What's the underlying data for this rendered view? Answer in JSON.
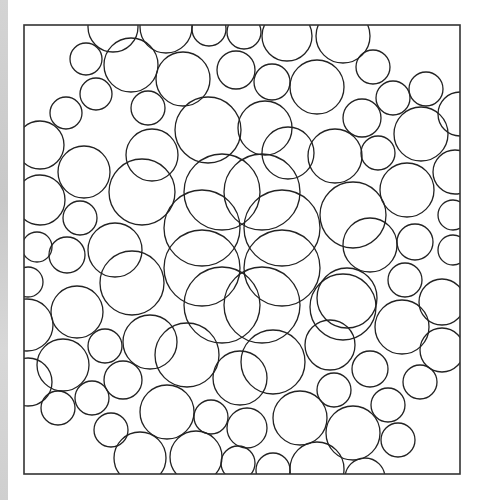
{
  "figure": {
    "frame": {
      "x": 24,
      "y": 25,
      "width": 436,
      "height": 449
    },
    "stroke_color": "#222222",
    "frame_color": "#333333",
    "background_color": "#ffffff",
    "side_strip_color": "#cfcfcf",
    "circles": [
      {
        "cx": 113,
        "cy": 27,
        "r": 25
      },
      {
        "cx": 166,
        "cy": 27,
        "r": 26
      },
      {
        "cx": 209,
        "cy": 29,
        "r": 17
      },
      {
        "cx": 244,
        "cy": 32,
        "r": 17
      },
      {
        "cx": 287,
        "cy": 36,
        "r": 25
      },
      {
        "cx": 343,
        "cy": 36,
        "r": 27
      },
      {
        "cx": 86,
        "cy": 59,
        "r": 16
      },
      {
        "cx": 131,
        "cy": 65,
        "r": 27
      },
      {
        "cx": 183,
        "cy": 79,
        "r": 27
      },
      {
        "cx": 236,
        "cy": 70,
        "r": 19
      },
      {
        "cx": 272,
        "cy": 82,
        "r": 18
      },
      {
        "cx": 317,
        "cy": 87,
        "r": 27
      },
      {
        "cx": 373,
        "cy": 67,
        "r": 17
      },
      {
        "cx": 393,
        "cy": 98,
        "r": 17
      },
      {
        "cx": 426,
        "cy": 89,
        "r": 17
      },
      {
        "cx": 460,
        "cy": 114,
        "r": 22
      },
      {
        "cx": 96,
        "cy": 94,
        "r": 16
      },
      {
        "cx": 66,
        "cy": 113,
        "r": 16
      },
      {
        "cx": 148,
        "cy": 108,
        "r": 17
      },
      {
        "cx": 208,
        "cy": 130,
        "r": 33
      },
      {
        "cx": 265,
        "cy": 128,
        "r": 27
      },
      {
        "cx": 362,
        "cy": 118,
        "r": 19
      },
      {
        "cx": 421,
        "cy": 134,
        "r": 27
      },
      {
        "cx": 40,
        "cy": 145,
        "r": 24
      },
      {
        "cx": 84,
        "cy": 172,
        "r": 26
      },
      {
        "cx": 152,
        "cy": 155,
        "r": 26
      },
      {
        "cx": 288,
        "cy": 153,
        "r": 26
      },
      {
        "cx": 335,
        "cy": 156,
        "r": 27
      },
      {
        "cx": 378,
        "cy": 153,
        "r": 17
      },
      {
        "cx": 455,
        "cy": 172,
        "r": 22
      },
      {
        "cx": 142,
        "cy": 192,
        "r": 33
      },
      {
        "cx": 40,
        "cy": 200,
        "r": 25
      },
      {
        "cx": 80,
        "cy": 218,
        "r": 17
      },
      {
        "cx": 407,
        "cy": 190,
        "r": 27
      },
      {
        "cx": 222,
        "cy": 192,
        "r": 38
      },
      {
        "cx": 262,
        "cy": 192,
        "r": 38
      },
      {
        "cx": 202,
        "cy": 228,
        "r": 38
      },
      {
        "cx": 282,
        "cy": 228,
        "r": 38
      },
      {
        "cx": 202,
        "cy": 268,
        "r": 38
      },
      {
        "cx": 282,
        "cy": 268,
        "r": 38
      },
      {
        "cx": 222,
        "cy": 305,
        "r": 38
      },
      {
        "cx": 262,
        "cy": 305,
        "r": 38
      },
      {
        "cx": 353,
        "cy": 215,
        "r": 33
      },
      {
        "cx": 453,
        "cy": 215,
        "r": 15
      },
      {
        "cx": 37,
        "cy": 247,
        "r": 15
      },
      {
        "cx": 67,
        "cy": 255,
        "r": 18
      },
      {
        "cx": 115,
        "cy": 250,
        "r": 27
      },
      {
        "cx": 370,
        "cy": 245,
        "r": 27
      },
      {
        "cx": 415,
        "cy": 242,
        "r": 18
      },
      {
        "cx": 453,
        "cy": 250,
        "r": 15
      },
      {
        "cx": 28,
        "cy": 282,
        "r": 15
      },
      {
        "cx": 132,
        "cy": 283,
        "r": 32
      },
      {
        "cx": 405,
        "cy": 280,
        "r": 17
      },
      {
        "cx": 347,
        "cy": 298,
        "r": 30
      },
      {
        "cx": 442,
        "cy": 302,
        "r": 23
      },
      {
        "cx": 77,
        "cy": 312,
        "r": 26
      },
      {
        "cx": 27,
        "cy": 325,
        "r": 26
      },
      {
        "cx": 343,
        "cy": 307,
        "r": 33
      },
      {
        "cx": 402,
        "cy": 327,
        "r": 27
      },
      {
        "cx": 105,
        "cy": 346,
        "r": 17
      },
      {
        "cx": 150,
        "cy": 342,
        "r": 27
      },
      {
        "cx": 187,
        "cy": 355,
        "r": 32
      },
      {
        "cx": 273,
        "cy": 362,
        "r": 32
      },
      {
        "cx": 240,
        "cy": 378,
        "r": 27
      },
      {
        "cx": 330,
        "cy": 345,
        "r": 25
      },
      {
        "cx": 442,
        "cy": 350,
        "r": 22
      },
      {
        "cx": 63,
        "cy": 365,
        "r": 26
      },
      {
        "cx": 28,
        "cy": 382,
        "r": 24
      },
      {
        "cx": 123,
        "cy": 380,
        "r": 19
      },
      {
        "cx": 370,
        "cy": 369,
        "r": 18
      },
      {
        "cx": 420,
        "cy": 382,
        "r": 17
      },
      {
        "cx": 334,
        "cy": 390,
        "r": 17
      },
      {
        "cx": 58,
        "cy": 408,
        "r": 17
      },
      {
        "cx": 92,
        "cy": 398,
        "r": 17
      },
      {
        "cx": 167,
        "cy": 412,
        "r": 27
      },
      {
        "cx": 211,
        "cy": 417,
        "r": 17
      },
      {
        "cx": 247,
        "cy": 428,
        "r": 20
      },
      {
        "cx": 300,
        "cy": 418,
        "r": 27
      },
      {
        "cx": 388,
        "cy": 405,
        "r": 17
      },
      {
        "cx": 353,
        "cy": 433,
        "r": 27
      },
      {
        "cx": 398,
        "cy": 440,
        "r": 17
      },
      {
        "cx": 111,
        "cy": 430,
        "r": 17
      },
      {
        "cx": 140,
        "cy": 458,
        "r": 26
      },
      {
        "cx": 196,
        "cy": 457,
        "r": 26
      },
      {
        "cx": 238,
        "cy": 463,
        "r": 17
      },
      {
        "cx": 273,
        "cy": 470,
        "r": 17
      },
      {
        "cx": 317,
        "cy": 469,
        "r": 27
      },
      {
        "cx": 365,
        "cy": 478,
        "r": 20
      }
    ]
  }
}
